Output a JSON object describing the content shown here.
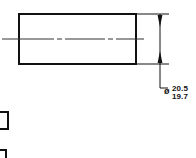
{
  "drawing": {
    "type": "mechanical-engineering-drawing",
    "view_name": "cylindrical-shaft-side-view",
    "background_color": "#ffffff",
    "line_color": "#111111",
    "part_outline": {
      "shape": "rectangle",
      "x": 19,
      "y": 14,
      "width": 117,
      "height": 50,
      "stroke_width": 2
    },
    "centerline": {
      "style": "dash-dot",
      "x_start": 2,
      "x_end": 148,
      "y": 39
    },
    "dimension": {
      "orientation": "vertical",
      "line_x": 160,
      "y_top": 14,
      "y_bottom": 64,
      "extension_line_top_y": 14,
      "extension_line_bottom_y": 64,
      "arrowheads": "both-ends-inward"
    },
    "leader": {
      "from_x": 160,
      "from_y": 64,
      "elbow_x": 160,
      "elbow_y": 88,
      "to_x": 168,
      "to_y": 88
    },
    "callout": {
      "symbol": "diameter-symbol",
      "symbol_glyph": "ø",
      "upper_limit": "20.5",
      "lower_limit": "19.7"
    },
    "adjacent_fragments": [
      {
        "name": "clipped-rectangle-fragment",
        "x": -6,
        "y": 112,
        "width": 14,
        "height": 17
      },
      {
        "name": "clipped-corner-mark",
        "x": -4,
        "y": 150,
        "width": 10,
        "height": 9
      }
    ]
  }
}
